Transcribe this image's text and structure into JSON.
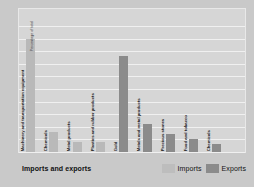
{
  "chart_data": {
    "type": "bar",
    "title": "Imports and exports",
    "xlabel": "",
    "ylabel": "Percentage of total",
    "ylim": [
      0,
      50
    ],
    "yticks": [
      0,
      5,
      10,
      15,
      20,
      25,
      30,
      35,
      40,
      45,
      50
    ],
    "grid": true,
    "legend_position": "bottom-right",
    "legend": [
      "Imports",
      "Exports"
    ],
    "colors": {
      "imports": "#b9b9b9",
      "exports": "#8b8b8b",
      "plot_background": "#d6d6d6",
      "figure_background": "#c9c9c9",
      "gridline": "#f0f0f0",
      "text": "#1e1e1e"
    },
    "categories": [
      "Machinery and transportation equipment",
      "Chemicals",
      "Metal products",
      "Plastics and rubber products",
      "Gold",
      "Metals and metal products",
      "Precious stones",
      "Food and tobacco",
      "Chemicals"
    ],
    "bars": [
      {
        "label": "Machinery and transportation equipment",
        "series": "Imports",
        "value": 45
      },
      {
        "label": "Chemicals",
        "series": "Imports",
        "value": 8
      },
      {
        "label": "Metal products",
        "series": "Imports",
        "value": 4
      },
      {
        "label": "Plastics and rubber products",
        "series": "Imports",
        "value": 4
      },
      {
        "label": "Gold",
        "series": "Exports",
        "value": 38
      },
      {
        "label": "Metals and metal products",
        "series": "Exports",
        "value": 11
      },
      {
        "label": "Precious stones",
        "series": "Exports",
        "value": 7
      },
      {
        "label": "Food and tobacco",
        "series": "Exports",
        "value": 5
      },
      {
        "label": "Chemicals",
        "series": "Exports",
        "value": 3
      }
    ],
    "series": [
      {
        "name": "Imports",
        "values": [
          45,
          8,
          4,
          4,
          null,
          null,
          null,
          null,
          null
        ]
      },
      {
        "name": "Exports",
        "values": [
          null,
          null,
          null,
          null,
          38,
          11,
          7,
          5,
          3
        ]
      }
    ]
  }
}
